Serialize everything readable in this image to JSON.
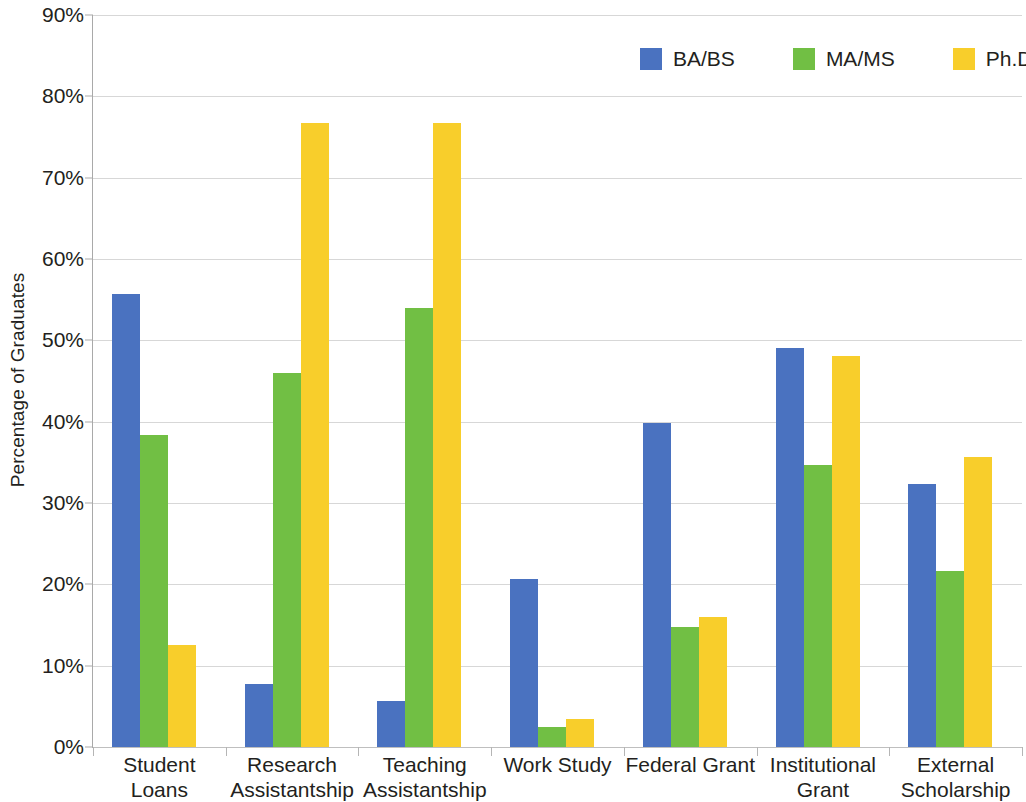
{
  "chart_data": {
    "type": "bar",
    "title": "",
    "xlabel": "",
    "ylabel": "Percentage of Graduates",
    "ylim": [
      0,
      90
    ],
    "ytick_labels": [
      "90%",
      "80%",
      "70%",
      "60%",
      "50%",
      "40%",
      "30%",
      "20%",
      "10%",
      "0%"
    ],
    "ytick_values": [
      90,
      80,
      70,
      60,
      50,
      40,
      30,
      20,
      10,
      0
    ],
    "grid": true,
    "legend_position": "top-right",
    "categories": [
      "Student Loans",
      "Research Assistantship",
      "Teaching Assistantship",
      "Work Study",
      "Federal Grant",
      "Institutional Grant",
      "External Scholarship"
    ],
    "series": [
      {
        "name": "BA/BS",
        "color": "#4a72c0",
        "values": [
          55.7,
          7.7,
          5.6,
          20.6,
          39.8,
          49.0,
          32.3
        ]
      },
      {
        "name": "MA/MS",
        "color": "#71bf44",
        "values": [
          38.4,
          46.0,
          54.0,
          2.5,
          14.7,
          34.7,
          21.6
        ]
      },
      {
        "name": "Ph.D.",
        "color": "#f8ce2b",
        "values": [
          12.5,
          76.7,
          76.7,
          3.5,
          16.0,
          48.1,
          35.6
        ]
      }
    ]
  },
  "legend": {
    "items": [
      {
        "label": "BA/BS",
        "color": "#4a72c0"
      },
      {
        "label": "MA/MS",
        "color": "#71bf44"
      },
      {
        "label": "Ph.D.",
        "color": "#f8ce2b"
      }
    ]
  },
  "axes": {
    "y_title": "Percentage of Graduates"
  }
}
